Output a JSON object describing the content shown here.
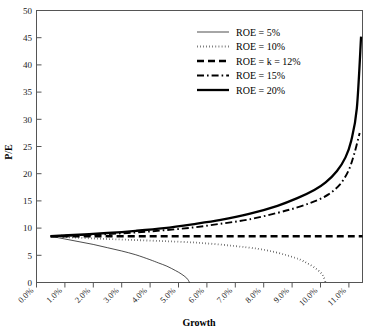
{
  "chart_data": {
    "type": "line",
    "title": "",
    "xlabel": "Growth",
    "ylabel": "P/E",
    "xlim": [
      0,
      11.5
    ],
    "ylim": [
      0,
      50
    ],
    "grid": false,
    "legend_position": "top-center",
    "x_tick_labels": [
      "0.0%",
      "1.0%",
      "2.0%",
      "3.0%",
      "4.0%",
      "5.0%",
      "6.0%",
      "7.0%",
      "8.0%",
      "9.0%",
      "10.0%",
      "11.0%"
    ],
    "x_tick_values": [
      0,
      1,
      2,
      3,
      4,
      5,
      6,
      7,
      8,
      9,
      10,
      11
    ],
    "y_tick_labels": [
      "0",
      "5",
      "10",
      "15",
      "20",
      "25",
      "30",
      "35",
      "40",
      "45",
      "50"
    ],
    "y_tick_values": [
      0,
      5,
      10,
      15,
      20,
      25,
      30,
      35,
      40,
      45,
      50
    ],
    "series": [
      {
        "name": "ROE = 5%",
        "style": "solid-thin",
        "stroke_width": 0.7,
        "dash": "none",
        "x": [
          0.5,
          1.0,
          1.5,
          2.0,
          2.5,
          3.0,
          3.5,
          4.0,
          4.3,
          4.6,
          4.9,
          5.1,
          5.3,
          5.4
        ],
        "y": [
          8.5,
          8.0,
          7.5,
          7.0,
          6.4,
          5.8,
          5.1,
          4.2,
          3.6,
          3.0,
          2.2,
          1.6,
          0.8,
          0.0
        ]
      },
      {
        "name": "ROE = 10%",
        "style": "dotted",
        "stroke_width": 1.8,
        "dash": "0.5,2.6",
        "x": [
          0.5,
          1.0,
          2.0,
          3.0,
          4.0,
          5.0,
          6.0,
          7.0,
          7.8,
          8.4,
          8.9,
          9.3,
          9.6,
          9.9,
          10.1,
          10.2
        ],
        "y": [
          8.5,
          8.35,
          8.1,
          7.9,
          7.7,
          7.5,
          7.2,
          6.7,
          6.2,
          5.6,
          4.9,
          4.2,
          3.4,
          2.4,
          1.3,
          0.0
        ]
      },
      {
        "name": "ROE = k = 12%",
        "style": "dashed",
        "stroke_width": 2.4,
        "dash": "7,4",
        "x": [
          0.5,
          2.0,
          4.0,
          6.0,
          8.0,
          10.0,
          11.5
        ],
        "y": [
          8.5,
          8.5,
          8.5,
          8.5,
          8.5,
          8.5,
          8.5
        ]
      },
      {
        "name": "ROE = 15%",
        "style": "dash-dot",
        "stroke_width": 1.9,
        "dash": "7,3,1.6,3",
        "x": [
          0.5,
          1.5,
          2.5,
          3.5,
          4.5,
          5.5,
          6.5,
          7.5,
          8.5,
          9.2,
          9.8,
          10.3,
          10.7,
          11.0,
          11.2,
          11.4
        ],
        "y": [
          8.5,
          8.7,
          8.9,
          9.2,
          9.6,
          10.1,
          10.8,
          11.6,
          12.8,
          13.8,
          14.9,
          16.2,
          18.0,
          20.5,
          23.5,
          27.5
        ]
      },
      {
        "name": "ROE = 20%",
        "style": "solid-thick",
        "stroke_width": 2.3,
        "dash": "none",
        "x": [
          0.5,
          1.5,
          2.5,
          3.5,
          4.5,
          5.5,
          6.5,
          7.5,
          8.5,
          9.2,
          9.8,
          10.2,
          10.6,
          10.9,
          11.1,
          11.3,
          11.45
        ],
        "y": [
          8.5,
          8.8,
          9.1,
          9.5,
          10.0,
          10.7,
          11.5,
          12.6,
          14.1,
          15.5,
          17.0,
          18.4,
          20.5,
          23.0,
          26.0,
          32.0,
          45.2
        ]
      }
    ],
    "legend": [
      {
        "label": "ROE = 5%",
        "style": "solid-thin"
      },
      {
        "label": "ROE = 10%",
        "style": "dotted"
      },
      {
        "label": "ROE = k = 12%",
        "style": "dashed"
      },
      {
        "label": "ROE = 15%",
        "style": "dash-dot"
      },
      {
        "label": "ROE = 20%",
        "style": "solid-thick"
      }
    ]
  },
  "colors": {
    "line": "#000000",
    "frame": "#555555",
    "background": "#ffffff"
  }
}
